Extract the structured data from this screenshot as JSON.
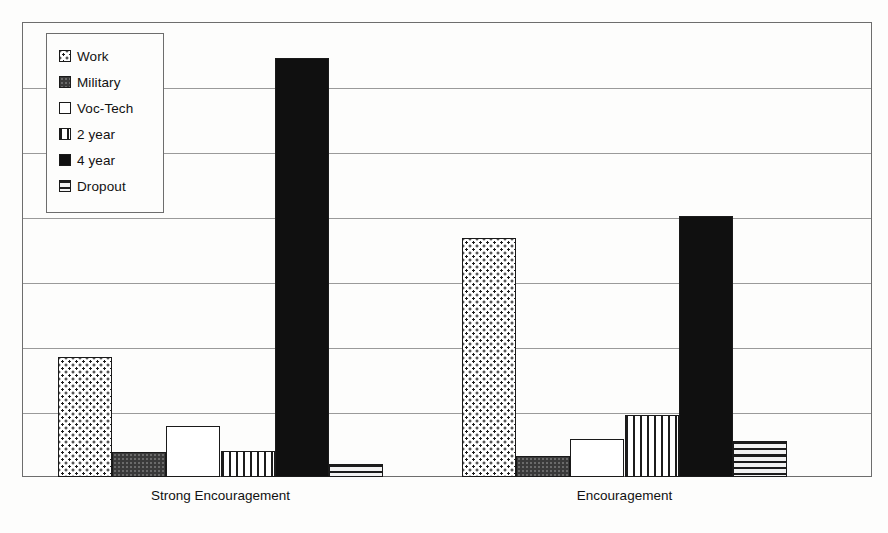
{
  "chart_data": {
    "type": "bar",
    "title": "",
    "xlabel": "",
    "ylabel": "",
    "grid": true,
    "legend_position": "top-left-inside",
    "axis": {
      "ylim": [
        0,
        7
      ],
      "gridline_count": 6,
      "y_tick_labels": []
    },
    "categories": [
      "Strong Encouragement",
      "Encouragement"
    ],
    "series": [
      {
        "name": "Work",
        "pattern": "dots",
        "values": [
          1.85,
          3.68
        ]
      },
      {
        "name": "Military",
        "pattern": "darkgrey",
        "values": [
          0.38,
          0.32
        ]
      },
      {
        "name": "Voc-Tech",
        "pattern": "white",
        "values": [
          0.78,
          0.58
        ]
      },
      {
        "name": "2 year",
        "pattern": "vstripe",
        "values": [
          0.4,
          0.95
        ]
      },
      {
        "name": "4 year",
        "pattern": "black",
        "values": [
          6.45,
          4.02
        ]
      },
      {
        "name": "Dropout",
        "pattern": "hstripe",
        "values": [
          0.2,
          0.55
        ]
      }
    ]
  },
  "legend": {
    "items": [
      {
        "label": "Work",
        "pattern": "dots"
      },
      {
        "label": "Military",
        "pattern": "darkgrey"
      },
      {
        "label": "Voc-Tech",
        "pattern": "white"
      },
      {
        "label": "2 year",
        "pattern": "vstripe"
      },
      {
        "label": "4 year",
        "pattern": "black"
      },
      {
        "label": "Dropout",
        "pattern": "hstripe"
      }
    ]
  },
  "colors": {
    "plot_background": "#fdfdfc",
    "frame": "#6d6d6d",
    "gridline": "#9a9a9a",
    "bar_outline": "#1a1a1a",
    "ink": "#111111"
  }
}
